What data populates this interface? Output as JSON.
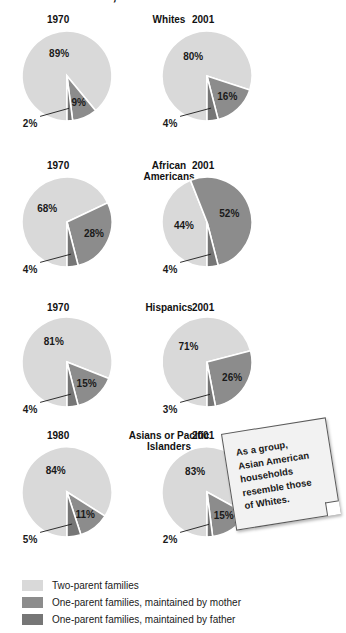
{
  "title": "United States, 1970-2001",
  "colors": {
    "two_parent": "#d9d9d9",
    "mother": "#8c8c8c",
    "father": "#767676",
    "outline": "#ffffff",
    "background": "#ffffff",
    "text": "#1a1a1a"
  },
  "legend": {
    "items": [
      {
        "label": "Two-parent families",
        "color_key": "two_parent"
      },
      {
        "label": "One-parent families, maintained by mother",
        "color_key": "mother"
      },
      {
        "label": "One-parent families, maintained by father",
        "color_key": "father"
      }
    ]
  },
  "note": {
    "line1": "As a group,",
    "line2": "Asian American",
    "line3": "households",
    "line4": "resemble those",
    "line5": "of Whites."
  },
  "chart_data": {
    "type": "pie",
    "title": "United States, 1970-2001",
    "legend_position": "bottom-left",
    "series_names": [
      "Two-parent families",
      "One-parent families, maintained by mother",
      "One-parent families, maintained by father"
    ],
    "groups": [
      {
        "name": "Whites",
        "pies": [
          {
            "year": "1970",
            "values": [
              89,
              9,
              2
            ],
            "labels": [
              "89%",
              "9%",
              "2%"
            ]
          },
          {
            "year": "2001",
            "values": [
              80,
              16,
              4
            ],
            "labels": [
              "80%",
              "16%",
              "4%"
            ]
          }
        ]
      },
      {
        "name": "African Americans",
        "pies": [
          {
            "year": "1970",
            "values": [
              68,
              28,
              4
            ],
            "labels": [
              "68%",
              "28%",
              "4%"
            ]
          },
          {
            "year": "2001",
            "values": [
              44,
              52,
              4
            ],
            "labels": [
              "44%",
              "52%",
              "4%"
            ]
          }
        ]
      },
      {
        "name": "Hispanics",
        "pies": [
          {
            "year": "1970",
            "values": [
              81,
              15,
              4
            ],
            "labels": [
              "81%",
              "15%",
              "4%"
            ]
          },
          {
            "year": "2001",
            "values": [
              71,
              26,
              3
            ],
            "labels": [
              "71%",
              "26%",
              "3%"
            ]
          }
        ]
      },
      {
        "name": "Asians or Pacific Islanders",
        "pies": [
          {
            "year": "1980",
            "values": [
              84,
              11,
              5
            ],
            "labels": [
              "84%",
              "11%",
              "5%"
            ]
          },
          {
            "year": "2001",
            "values": [
              83,
              15,
              2
            ],
            "labels": [
              "83%",
              "15%",
              "2%"
            ]
          }
        ]
      }
    ]
  },
  "layout": {
    "group_name_lines": {
      "Whites": [
        "Whites"
      ],
      "African Americans": [
        "African",
        "Americans"
      ],
      "Hispanics": [
        "Hispanics"
      ],
      "Asians or Pacific Islanders": [
        "Asians or Pacific",
        "Islanders"
      ]
    },
    "row_tops": [
      14,
      160,
      302,
      430
    ],
    "pie_centers_y": [
      76,
      222,
      362,
      492
    ],
    "pie_centers_x": [
      67,
      207
    ],
    "radius": 45
  }
}
